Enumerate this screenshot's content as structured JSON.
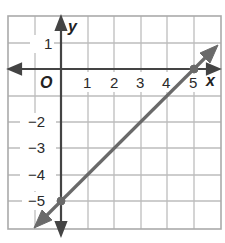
{
  "graph": {
    "x_axis_label": "x",
    "y_axis_label": "y",
    "origin_label": "O",
    "x_tick_labels": [
      "1",
      "2",
      "3",
      "4",
      "5"
    ],
    "y_tick_labels": [
      "1",
      "−2",
      "−3",
      "−4",
      "−5"
    ],
    "grid": {
      "x_range": [
        -2,
        6
      ],
      "y_range": [
        -6,
        2
      ]
    },
    "line": {
      "points": [
        [
          0,
          -5
        ],
        [
          5,
          0
        ]
      ],
      "slope": 1,
      "y_intercept": -5,
      "x_intercept": 5,
      "color": "#666666"
    },
    "colors": {
      "grid": "#b8b8b8",
      "axis": "#444444",
      "border": "#aaaaaa"
    }
  }
}
